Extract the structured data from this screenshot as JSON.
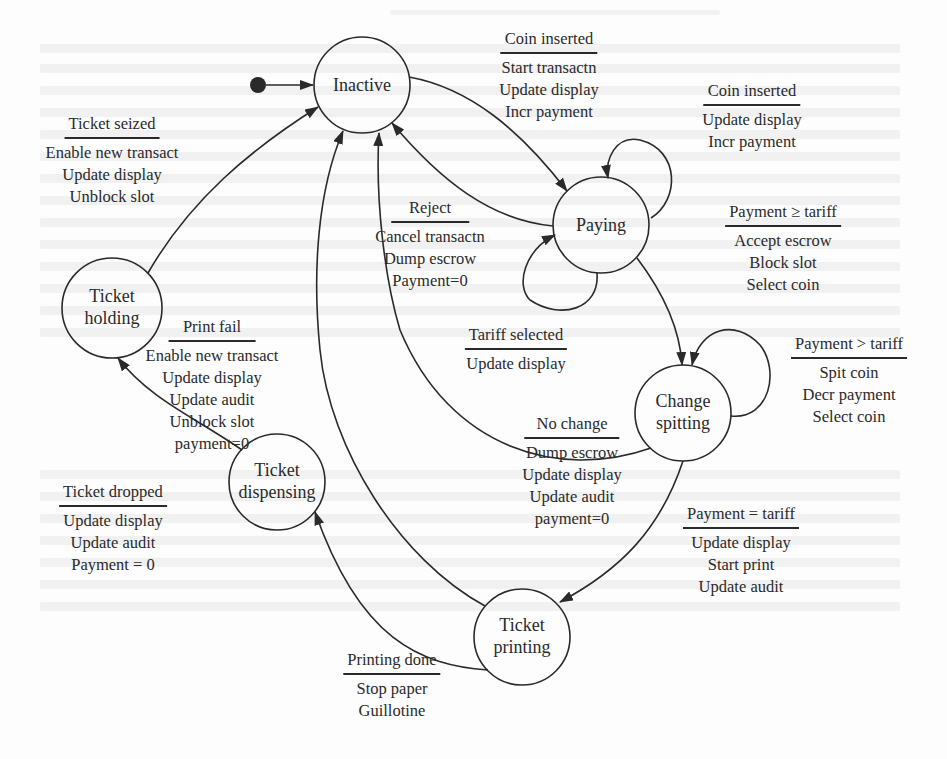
{
  "diagram": {
    "type": "state-machine",
    "colors": {
      "ink": "#2a2a2a",
      "background": "#fdfdfd",
      "ghost_text": "#f1f1f1"
    },
    "initial_marker": {
      "target": "Inactive"
    },
    "states": [
      {
        "id": "inactive",
        "name": "Inactive",
        "lines": [
          "Inactive"
        ]
      },
      {
        "id": "paying",
        "name": "Paying",
        "lines": [
          "Paying"
        ]
      },
      {
        "id": "holding",
        "name": "Ticket holding",
        "lines": [
          "Ticket",
          "holding"
        ]
      },
      {
        "id": "change",
        "name": "Change spitting",
        "lines": [
          "Change",
          "spitting"
        ]
      },
      {
        "id": "dispensing",
        "name": "Ticket dispensing",
        "lines": [
          "Ticket",
          "dispensing"
        ]
      },
      {
        "id": "printing",
        "name": "Ticket printing",
        "lines": [
          "Ticket",
          "printing"
        ]
      }
    ],
    "transitions": [
      {
        "id": "t1",
        "from": "Inactive",
        "to": "Paying",
        "event": "Coin inserted",
        "actions": [
          "Start transactn",
          "Update display",
          "Incr payment"
        ]
      },
      {
        "id": "t2",
        "from": "Paying",
        "to": "Paying",
        "event": "Coin inserted",
        "actions": [
          "Update display",
          "Incr payment"
        ]
      },
      {
        "id": "t3",
        "from": "Paying",
        "to": "Inactive",
        "event": "Reject",
        "actions": [
          "Cancel transactn",
          "Dump escrow",
          "Payment=0"
        ]
      },
      {
        "id": "t4",
        "from": "Paying",
        "to": "Paying",
        "event": "Tariff selected",
        "actions": [
          "Update display"
        ]
      },
      {
        "id": "t5",
        "from": "Paying",
        "to": "Change spitting",
        "event": "Payment ≥ tariff",
        "actions": [
          "Accept escrow",
          "Block slot",
          "Select coin"
        ]
      },
      {
        "id": "t6",
        "from": "Change spitting",
        "to": "Change spitting",
        "event": "Payment > tariff",
        "actions": [
          "Spit coin",
          "Decr payment",
          "Select coin"
        ]
      },
      {
        "id": "t7",
        "from": "Change spitting",
        "to": "Inactive",
        "event": "No change",
        "actions": [
          "Dump escrow",
          "Update display",
          "Update audit",
          "payment=0"
        ]
      },
      {
        "id": "t8",
        "from": "Change spitting",
        "to": "Ticket printing",
        "event": "Payment = tariff",
        "actions": [
          "Update display",
          "Start print",
          "Update audit"
        ]
      },
      {
        "id": "t9",
        "from": "Ticket printing",
        "to": "Ticket dispensing",
        "event": "Printing done",
        "actions": [
          "Stop paper",
          "Guillotine"
        ]
      },
      {
        "id": "t10",
        "from": "Ticket printing",
        "to": "Ticket holding",
        "event": "Print fail",
        "actions": [
          "Enable new transact",
          "Update display",
          "Update audit",
          "Unblock slot",
          "payment=0"
        ]
      },
      {
        "id": "t11",
        "from": "Ticket dispensing",
        "to": "Inactive",
        "event": "Ticket dropped",
        "actions": [
          "Update display",
          "Update audit",
          "Payment = 0"
        ]
      },
      {
        "id": "t12",
        "from": "Ticket holding",
        "to": "Inactive",
        "event": "Ticket seized",
        "actions": [
          "Enable new transact",
          "Update display",
          "Unblock slot"
        ]
      }
    ]
  }
}
